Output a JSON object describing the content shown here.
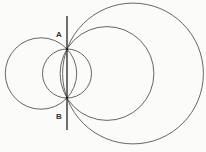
{
  "diagram": {
    "points": {
      "A": {
        "label": "A",
        "x": 67,
        "y": 49
      },
      "B": {
        "label": "B",
        "x": 67,
        "y": 98
      }
    },
    "line": {
      "x": 67,
      "y1": 16,
      "y2": 130
    },
    "circles": [
      {
        "name": "left-circle",
        "cx": 41,
        "cy": 73.5,
        "r": 35.7
      },
      {
        "name": "small-circle",
        "cx": 67,
        "cy": 73.5,
        "r": 24.5
      },
      {
        "name": "medium-circle",
        "cx": 107,
        "cy": 73.5,
        "r": 46.9
      },
      {
        "name": "large-circle",
        "cx": 133,
        "cy": 73.5,
        "r": 70.4
      }
    ],
    "stroke_color": "#555555"
  }
}
